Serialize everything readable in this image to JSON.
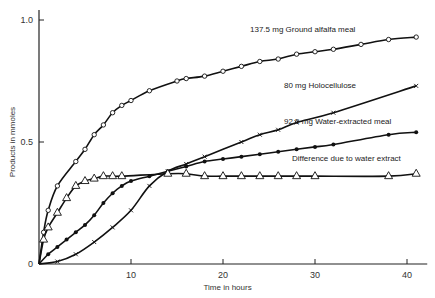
{
  "chart_data": {
    "type": "line",
    "title": "",
    "xlabel": "Time in hours",
    "ylabel": "Products in mmoles",
    "xlim": [
      0,
      42
    ],
    "ylim": [
      0,
      1.05
    ],
    "x_ticks": [
      0,
      10,
      20,
      30,
      40
    ],
    "x_tick_labels": [
      "",
      "10",
      "20",
      "30",
      "40"
    ],
    "y_ticks": [
      0,
      0.5,
      1.0
    ],
    "y_tick_labels": [
      "0",
      "0.5",
      "1.0"
    ],
    "grid": false,
    "legend": "inline labels",
    "series": [
      {
        "name": "137.5 mg Ground alfalfa meal",
        "marker": "open-circle",
        "x": [
          0,
          0.5,
          1,
          2,
          4,
          5,
          6,
          7,
          8,
          9,
          10,
          12,
          15,
          16,
          18,
          20,
          22,
          24,
          26,
          28,
          30,
          32,
          35,
          38,
          41
        ],
        "values": [
          0,
          0.13,
          0.22,
          0.32,
          0.42,
          0.47,
          0.53,
          0.57,
          0.62,
          0.65,
          0.67,
          0.71,
          0.75,
          0.76,
          0.77,
          0.79,
          0.81,
          0.83,
          0.84,
          0.86,
          0.87,
          0.88,
          0.9,
          0.92,
          0.93
        ],
        "label_pos": [
          250,
          32
        ]
      },
      {
        "name": "80 mg Holocellulose",
        "marker": "x",
        "x": [
          0,
          2,
          4,
          6,
          8,
          10,
          12,
          14,
          16,
          18,
          22,
          24,
          26,
          28,
          32,
          41
        ],
        "values": [
          0,
          0.01,
          0.04,
          0.09,
          0.15,
          0.22,
          0.32,
          0.38,
          0.41,
          0.44,
          0.5,
          0.53,
          0.55,
          0.58,
          0.62,
          0.73
        ],
        "label_pos": [
          284,
          88
        ]
      },
      {
        "name": "92.5 mg Water-extracted meal",
        "marker": "filled-circle",
        "x": [
          0,
          1,
          2,
          3,
          4,
          5,
          6,
          7,
          8,
          9,
          10,
          12,
          14,
          16,
          18,
          20,
          22,
          24,
          26,
          28,
          30,
          32,
          38,
          41
        ],
        "values": [
          0,
          0.04,
          0.07,
          0.1,
          0.13,
          0.16,
          0.2,
          0.25,
          0.29,
          0.32,
          0.34,
          0.36,
          0.38,
          0.4,
          0.42,
          0.43,
          0.44,
          0.45,
          0.46,
          0.47,
          0.48,
          0.49,
          0.53,
          0.54
        ],
        "label_pos": [
          284,
          124
        ]
      },
      {
        "name": "Difference due to water extract",
        "marker": "open-triangle",
        "x": [
          0,
          0.5,
          1,
          2,
          3,
          4,
          5,
          6,
          7,
          8,
          9,
          14,
          16,
          18,
          20,
          22,
          24,
          26,
          28,
          30,
          38,
          41
        ],
        "values": [
          0,
          0.1,
          0.15,
          0.21,
          0.27,
          0.32,
          0.34,
          0.35,
          0.36,
          0.36,
          0.36,
          0.37,
          0.37,
          0.36,
          0.36,
          0.36,
          0.36,
          0.36,
          0.36,
          0.36,
          0.36,
          0.37
        ],
        "label_pos": [
          292,
          161
        ]
      }
    ]
  }
}
